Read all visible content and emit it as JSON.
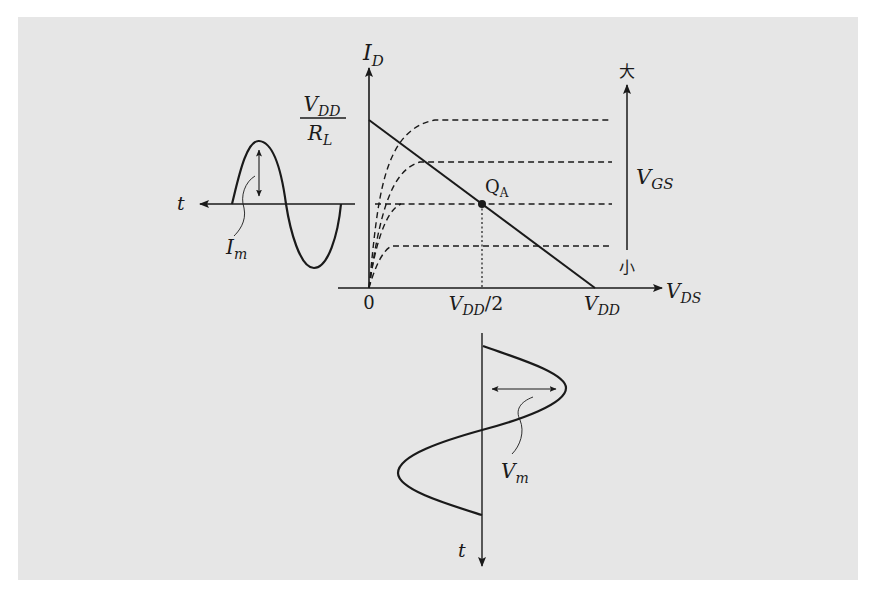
{
  "figure": {
    "background_color": "#e6e6e6",
    "ink_color": "#1a1a1a",
    "axes": {
      "y_axis_label_main": "I",
      "y_axis_label_sub": "D",
      "x_axis_label_main": "V",
      "x_axis_label_sub": "DS",
      "y_intercept_numerator_main": "V",
      "y_intercept_numerator_sub": "DD",
      "y_intercept_denominator_main": "R",
      "y_intercept_denominator_sub": "L",
      "origin_label": "0",
      "x_mid_label_main": "V",
      "x_mid_label_sub": "DD",
      "x_mid_label_suffix": "/2",
      "x_end_label_main": "V",
      "x_end_label_sub": "DD"
    },
    "operating_point": {
      "label_main": "Q",
      "label_sub": "A"
    },
    "vgs_scale": {
      "label_main": "V",
      "label_sub": "GS",
      "top_label": "大",
      "bottom_label": "小"
    },
    "input_wave": {
      "time_label": "t",
      "amplitude_label_main": "I",
      "amplitude_label_sub": "m"
    },
    "output_wave": {
      "time_label": "t",
      "amplitude_label_main": "V",
      "amplitude_label_sub": "m"
    }
  }
}
